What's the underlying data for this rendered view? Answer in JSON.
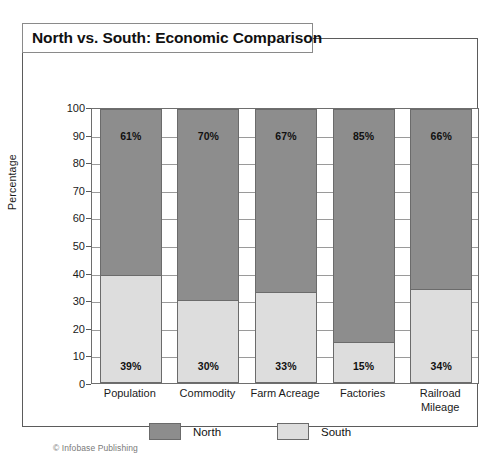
{
  "figure": {
    "title": "North vs. South: Economic Comparison",
    "credit": "© Infobase Publishing"
  },
  "legend": {
    "position": "bottom-center",
    "entries": [
      {
        "label": "North",
        "color": "#8d8d8d"
      },
      {
        "label": "South",
        "color": "#dddddd"
      }
    ]
  },
  "axis": {
    "ylabel": "Percentage",
    "yticks": [
      "0",
      "10",
      "20",
      "30",
      "40",
      "50",
      "60",
      "70",
      "80",
      "90",
      "100"
    ]
  },
  "chart_data": {
    "type": "bar",
    "subtype": "stacked-100-percent",
    "title": "North vs. South: Economic Comparison",
    "xlabel": "",
    "ylabel": "Percentage",
    "ylim": [
      0,
      100
    ],
    "ytick_step": 10,
    "grid": true,
    "legend_position": "bottom-center",
    "categories": [
      "Population",
      "Commodity",
      "Farm Acreage",
      "Factories",
      "Railroad Mileage"
    ],
    "series": [
      {
        "name": "North",
        "color": "#8d8d8d",
        "values": [
          61,
          70,
          67,
          85,
          66
        ],
        "labels": [
          "61%",
          "70%",
          "67%",
          "85%",
          "66%"
        ]
      },
      {
        "name": "South",
        "color": "#dddddd",
        "values": [
          39,
          30,
          33,
          15,
          34
        ],
        "labels": [
          "39%",
          "30%",
          "33%",
          "15%",
          "34%"
        ]
      }
    ]
  }
}
